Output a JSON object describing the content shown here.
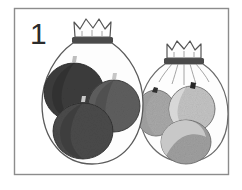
{
  "figure": {
    "label": "1",
    "title": "Two tied bags of fruit",
    "description": "A hand-drawn grayscale picture showing two gathered cloth bags tied at the neck. The larger left bag holds three dark fruits; the smaller right bag behind it holds three light fruits.",
    "border_color": "#8c8c8c",
    "background_color": "#ffffff",
    "ink_color": "#3a3a3a",
    "outline_color": "#555555"
  },
  "bags": [
    {
      "id": "left-bag",
      "name": "large-bag",
      "size_label": "large",
      "tie_color": "#4a4a4a",
      "body_fill": "#fdfdfd",
      "outline_color": "#5a5a5a",
      "fruit_count": 3,
      "fruit_shade": "dark"
    },
    {
      "id": "right-bag",
      "name": "small-bag",
      "size_label": "small",
      "tie_color": "#4a4a4a",
      "body_fill": "#fdfdfd",
      "outline_color": "#6a6a6a",
      "fruit_count": 3,
      "fruit_shade": "light"
    }
  ],
  "fruits": {
    "dark": [
      {
        "id": "dark-fruit-1",
        "fill": "#3c3c3c",
        "shade": "#2e2e2e",
        "stem": "#bdbdbd"
      },
      {
        "id": "dark-fruit-2",
        "fill": "#5e5e5e",
        "shade": "#4a4a4a",
        "stem": "#c6c6c6"
      },
      {
        "id": "dark-fruit-3",
        "fill": "#4a4a4a",
        "shade": "#3a3a3a",
        "stem": "#c9c9c9"
      }
    ],
    "light": [
      {
        "id": "light-fruit-1",
        "fill": "#a9a9a9",
        "shade": "#9a9a9a",
        "stem": "#2f2f2f"
      },
      {
        "id": "light-fruit-2",
        "fill": "#c4c4c4",
        "shade": "#b0b0b0",
        "stem": "#262626"
      },
      {
        "id": "light-fruit-3",
        "fill": "#a0a0a0",
        "shade": "#bcbcbc",
        "stem": "#2f2f2f"
      }
    ]
  },
  "counts": {
    "dark_fruit_total": 3,
    "light_fruit_total": 3,
    "bag_total": 2
  }
}
